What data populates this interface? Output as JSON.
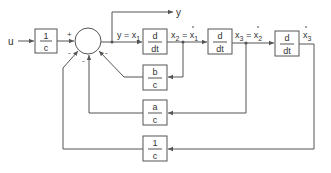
{
  "diagram": {
    "input_label": "u",
    "output_label": "y",
    "input_gain": {
      "num": "1",
      "den": "c"
    },
    "summing_junction": {
      "signs": [
        "+",
        "-",
        "-",
        "-"
      ]
    },
    "signals": {
      "y_eq": "y = x",
      "y_sub": "1",
      "x2_label": "x",
      "x2_sub": "2",
      "x2_eq": " = ",
      "x1dot": "x",
      "x1dot_sub": "1",
      "x3_label": "x",
      "x3_sub": "3",
      "x3_eq": " = ",
      "x2dot": "x",
      "x2dot_sub": "2",
      "x3dot": "x",
      "x3dot_sub": "3"
    },
    "derivative_blocks": [
      {
        "num": "d",
        "den": "dt"
      },
      {
        "num": "d",
        "den": "dt"
      },
      {
        "num": "d",
        "den": "dt"
      }
    ],
    "feedback_blocks": [
      {
        "num": "b",
        "den": "c"
      },
      {
        "num": "a",
        "den": "c"
      },
      {
        "num": "1",
        "den": "c"
      }
    ]
  }
}
